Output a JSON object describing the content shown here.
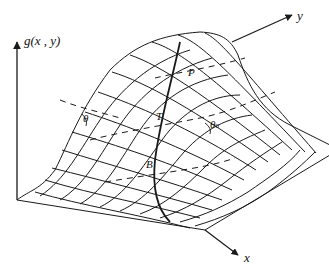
{
  "diagram": {
    "type": "3d-surface-mesh",
    "axes": {
      "vertical": "g(x , y)",
      "y": "y",
      "x": "x"
    },
    "points": [
      {
        "id": "P",
        "label": "P"
      },
      {
        "id": "T",
        "label": "T"
      },
      {
        "id": "B",
        "label": "B"
      }
    ],
    "angles": [
      {
        "id": "theta-left",
        "symbol": "θ",
        "sub": ""
      },
      {
        "id": "theta-0",
        "symbol": "θ",
        "sub": "0"
      }
    ],
    "colors": {
      "line": "#1a1a1a",
      "background": "#ffffff"
    }
  }
}
